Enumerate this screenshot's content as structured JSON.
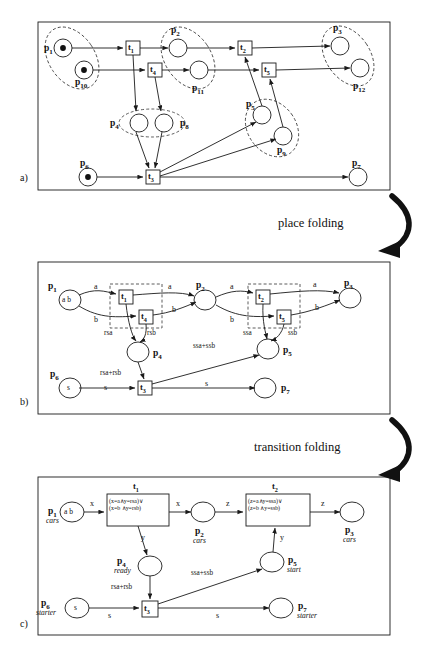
{
  "figure": {
    "panels": [
      {
        "letter": "a)"
      },
      {
        "letter": "b)"
      },
      {
        "letter": "c)"
      }
    ],
    "fold_labels": [
      {
        "text": "place folding"
      },
      {
        "text": "transition folding"
      }
    ]
  },
  "panel_a": {
    "places": [
      {
        "id": "p1",
        "label": "p",
        "sub": "1",
        "tokens": 1
      },
      {
        "id": "p10",
        "label": "p",
        "sub": "10",
        "tokens": 1
      },
      {
        "id": "p2",
        "label": "p",
        "sub": "2",
        "tokens": 0
      },
      {
        "id": "p11",
        "label": "p",
        "sub": "11",
        "tokens": 0
      },
      {
        "id": "p3",
        "label": "p",
        "sub": "3",
        "tokens": 0
      },
      {
        "id": "p12",
        "label": "p",
        "sub": "12",
        "tokens": 0
      },
      {
        "id": "p4",
        "label": "p",
        "sub": "4",
        "tokens": 0
      },
      {
        "id": "p8",
        "label": "p",
        "sub": "8",
        "tokens": 0
      },
      {
        "id": "p5",
        "label": "p",
        "sub": "5",
        "tokens": 0
      },
      {
        "id": "p9",
        "label": "p",
        "sub": "9",
        "tokens": 0
      },
      {
        "id": "p6",
        "label": "p",
        "sub": "6",
        "tokens": 1
      },
      {
        "id": "p7",
        "label": "p",
        "sub": "7",
        "tokens": 0
      }
    ],
    "transitions": [
      {
        "id": "t1",
        "label": "t",
        "sub": "1"
      },
      {
        "id": "t4",
        "label": "t",
        "sub": "4"
      },
      {
        "id": "t2",
        "label": "t",
        "sub": "2"
      },
      {
        "id": "t5",
        "label": "t",
        "sub": "5"
      },
      {
        "id": "t3",
        "label": "t",
        "sub": "3"
      }
    ],
    "folding_groups": [
      {
        "name": "group-p1-p10",
        "members": [
          "p1",
          "p10"
        ]
      },
      {
        "name": "group-p2-p11",
        "members": [
          "p2",
          "p11"
        ]
      },
      {
        "name": "group-p3-p12",
        "members": [
          "p3",
          "p12"
        ]
      },
      {
        "name": "group-p4-p8",
        "members": [
          "p4",
          "p8"
        ]
      },
      {
        "name": "group-p5-p9",
        "members": [
          "p5",
          "p9"
        ]
      }
    ]
  },
  "panel_b": {
    "places": [
      {
        "id": "p1",
        "label": "p",
        "sub": "1",
        "marking": "a b"
      },
      {
        "id": "p2",
        "label": "p",
        "sub": "2",
        "marking": ""
      },
      {
        "id": "p3",
        "label": "p",
        "sub": "3",
        "marking": ""
      },
      {
        "id": "p4",
        "label": "p",
        "sub": "4",
        "marking": ""
      },
      {
        "id": "p5",
        "label": "p",
        "sub": "5",
        "marking": ""
      },
      {
        "id": "p6",
        "label": "p",
        "sub": "6",
        "marking": "s"
      },
      {
        "id": "p7",
        "label": "p",
        "sub": "7",
        "marking": ""
      }
    ],
    "transitions": [
      {
        "id": "t1",
        "label": "t",
        "sub": "1"
      },
      {
        "id": "t4",
        "label": "t",
        "sub": "4"
      },
      {
        "id": "t2",
        "label": "t",
        "sub": "2"
      },
      {
        "id": "t5",
        "label": "t",
        "sub": "5"
      },
      {
        "id": "t3",
        "label": "t",
        "sub": "3"
      }
    ],
    "arc_labels": [
      {
        "id": "b-a1",
        "text": "a"
      },
      {
        "id": "b-b1",
        "text": "b"
      },
      {
        "id": "b-a2",
        "text": "a"
      },
      {
        "id": "b-b2",
        "text": "b"
      },
      {
        "id": "b-a3",
        "text": "a"
      },
      {
        "id": "b-b3",
        "text": "b"
      },
      {
        "id": "b-a4",
        "text": "a"
      },
      {
        "id": "b-b4",
        "text": "b"
      },
      {
        "id": "b-rsa",
        "text": "rsa"
      },
      {
        "id": "b-rsb",
        "text": "rsb"
      },
      {
        "id": "b-ssa",
        "text": "ssa"
      },
      {
        "id": "b-ssb",
        "text": "ssb"
      },
      {
        "id": "b-rsasum",
        "text": "rsa+rsb"
      },
      {
        "id": "b-ssasum",
        "text": "ssa+ssb"
      },
      {
        "id": "b-s1",
        "text": "s"
      },
      {
        "id": "b-s2",
        "text": "s"
      }
    ],
    "folding_groups": [
      {
        "name": "group-t1-t4",
        "members": [
          "t1",
          "t4"
        ]
      },
      {
        "name": "group-t2-t5",
        "members": [
          "t2",
          "t5"
        ]
      }
    ]
  },
  "panel_c": {
    "places": [
      {
        "id": "p1",
        "label": "p",
        "sub": "1",
        "type": "cars",
        "marking": "a b"
      },
      {
        "id": "p2",
        "label": "p",
        "sub": "2",
        "type": "cars",
        "marking": ""
      },
      {
        "id": "p3",
        "label": "p",
        "sub": "3",
        "type": "cars",
        "marking": ""
      },
      {
        "id": "p4",
        "label": "p",
        "sub": "4",
        "type": "ready",
        "marking": ""
      },
      {
        "id": "p5",
        "label": "p",
        "sub": "5",
        "type": "start",
        "marking": ""
      },
      {
        "id": "p6",
        "label": "p",
        "sub": "6",
        "type": "starter",
        "marking": "s"
      },
      {
        "id": "p7",
        "label": "p",
        "sub": "7",
        "type": "starter",
        "marking": ""
      }
    ],
    "transitions": [
      {
        "id": "t1",
        "label": "t",
        "sub": "1",
        "guard_line1": "(x=a∧y=rsa)∨",
        "guard_line2": "(x=b ∧y=rsb)"
      },
      {
        "id": "t2",
        "label": "t",
        "sub": "2",
        "guard_line1": "(z=a∧y=ssa)∨",
        "guard_line2": "(z=b ∧y=ssb)"
      },
      {
        "id": "t3",
        "label": "t",
        "sub": "3",
        "guard_line1": "",
        "guard_line2": ""
      }
    ],
    "arc_labels": [
      {
        "id": "c-x1",
        "text": "x"
      },
      {
        "id": "c-x2",
        "text": "x"
      },
      {
        "id": "c-z1",
        "text": "z"
      },
      {
        "id": "c-z2",
        "text": "z"
      },
      {
        "id": "c-y1",
        "text": "y"
      },
      {
        "id": "c-y2",
        "text": "y"
      },
      {
        "id": "c-rsasum",
        "text": "rsa+rsb"
      },
      {
        "id": "c-ssasum",
        "text": "ssa+ssb"
      },
      {
        "id": "c-s1",
        "text": "s"
      },
      {
        "id": "c-s2",
        "text": "s"
      }
    ]
  },
  "colors": {
    "stroke": "#1a1a1a",
    "dashed": "#333333",
    "background": "#ffffff"
  }
}
